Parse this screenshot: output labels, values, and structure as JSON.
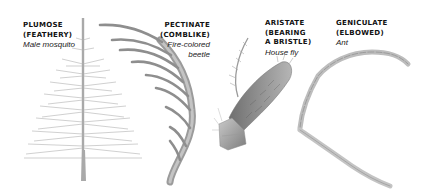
{
  "figure": {
    "panels": [
      {
        "id": "plumose",
        "type_line1": "PLUMOSE",
        "type_line2": "(FEATHERY)",
        "example": "Male mosquito"
      },
      {
        "id": "pectinate",
        "type_line1": "PECTINATE",
        "type_line2": "(COMBLIKE)",
        "example_line1": "Fire-colored",
        "example_line2": "beetle"
      },
      {
        "id": "aristate",
        "type_line1": "ARISTATE",
        "type_line2": "(BEARING",
        "type_line3": "A BRISTLE)",
        "example": "House fly"
      },
      {
        "id": "geniculate",
        "type_line1": "GENICULATE",
        "type_line2": "(ELBOWED)",
        "example": "Ant"
      }
    ],
    "colors": {
      "ink": "#111111",
      "illustration": "#8a8a8a",
      "background": "#ffffff"
    }
  }
}
